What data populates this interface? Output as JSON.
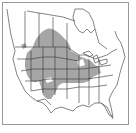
{
  "map": {
    "title": "",
    "region": "North America (Canada, United States, northern Mexico)",
    "range_fill_color": "#a6a6a6",
    "border_color": "#333333",
    "frame_color": "#9a9a9a",
    "background_color": "#ffffff",
    "highlighted_range": "Great Plains and Prairie Provinces extending east to Great Lakes and Ohio Valley",
    "caption": ""
  }
}
